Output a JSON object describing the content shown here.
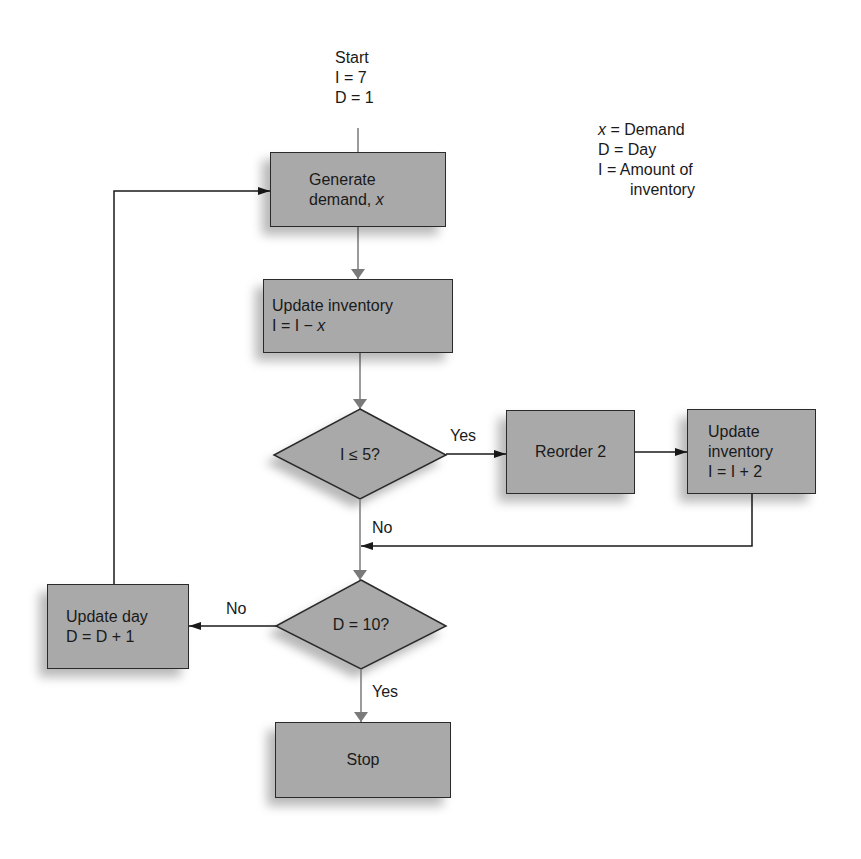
{
  "diagram": {
    "type": "flowchart",
    "start": {
      "title": "Start",
      "init_inventory": "I = 7",
      "init_day": "D = 1"
    },
    "legend": {
      "items": [
        {
          "symbol": "x",
          "text": " = Demand"
        },
        {
          "symbol": "D",
          "text": " = Day"
        },
        {
          "symbol": "I",
          "text": " = Amount of"
        },
        {
          "symbol": "",
          "text": "inventory"
        }
      ]
    },
    "nodes": {
      "generate": {
        "line1": "Generate",
        "line2_prefix": "demand, ",
        "line2_var": "x"
      },
      "update_inventory": {
        "line1": "Update inventory",
        "line2_prefix": "I = I − ",
        "line2_var": "x"
      },
      "decision_inventory": {
        "text": "I ≤ 5?"
      },
      "reorder": {
        "text": "Reorder 2"
      },
      "update_inventory_2": {
        "line1": "Update",
        "line2": "inventory",
        "line3": "I = I + 2"
      },
      "decision_day": {
        "text": "D = 10?"
      },
      "update_day": {
        "line1": "Update day",
        "line2": "D = D + 1"
      },
      "stop": {
        "text": "Stop"
      }
    },
    "edge_labels": {
      "inventory_yes": "Yes",
      "inventory_no": "No",
      "day_no": "No",
      "day_yes": "Yes"
    },
    "colors": {
      "node_fill": "#a9a9a9",
      "line_dark": "#1a1a1a",
      "line_gray": "#7a7a7a"
    }
  }
}
